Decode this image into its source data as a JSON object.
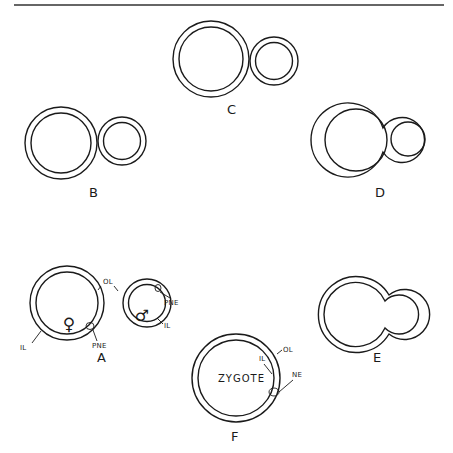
{
  "figure": {
    "colors": {
      "ink": "#1a1a1a",
      "background": "#ffffff"
    },
    "stages": [
      {
        "id": "A",
        "label": "A",
        "annotations": [
          "OL",
          "PNE",
          "IL",
          "PNE",
          "IL"
        ],
        "symbols": [
          "female-symbol",
          "male-symbol"
        ]
      },
      {
        "id": "B",
        "label": "B"
      },
      {
        "id": "C",
        "label": "C"
      },
      {
        "id": "D",
        "label": "D"
      },
      {
        "id": "E",
        "label": "E"
      },
      {
        "id": "F",
        "label": "F",
        "center_text": "ZYGOTE",
        "annotations": [
          "OL",
          "IL",
          "NE"
        ]
      }
    ],
    "labels": {
      "A": "A",
      "B": "B",
      "C": "C",
      "D": "D",
      "E": "E",
      "F": "F",
      "ol": "OL",
      "il": "IL",
      "pne": "PNE",
      "ne": "NE",
      "zygote": "ZYGOTE",
      "female": "♀",
      "male": "♂"
    }
  }
}
